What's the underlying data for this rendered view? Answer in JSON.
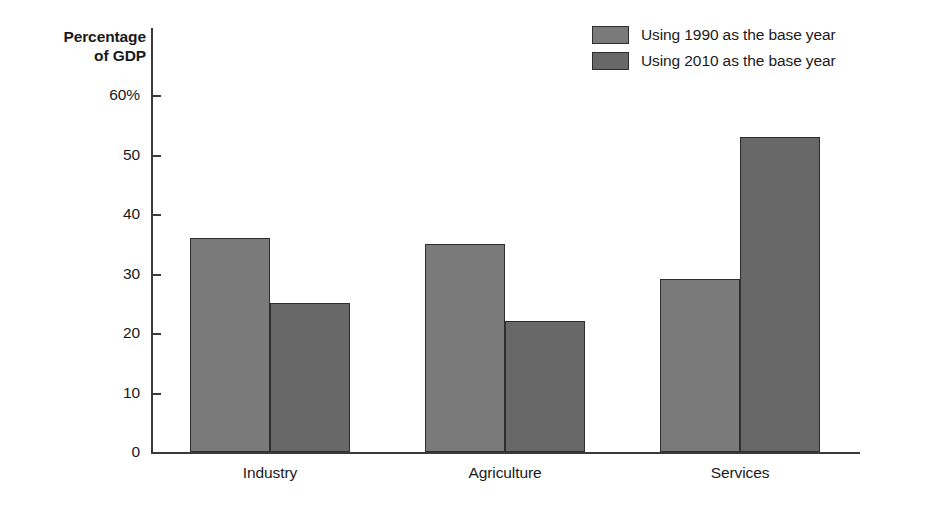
{
  "chart_data": {
    "type": "bar",
    "title": "",
    "ylabel": "Percentage\nof GDP",
    "xlabel": "",
    "categories": [
      "Industry",
      "Agriculture",
      "Services"
    ],
    "series": [
      {
        "name": "Using 1990 as the base year",
        "values": [
          36,
          35,
          29
        ],
        "color": "#7a7a7a"
      },
      {
        "name": "Using 2010 as the base year",
        "values": [
          25,
          22,
          53
        ],
        "color": "#686868"
      }
    ],
    "ylim": [
      0,
      60
    ],
    "yticks": [
      0,
      10,
      20,
      30,
      40,
      50,
      60
    ],
    "ytick_labels": [
      "0",
      "10",
      "20",
      "30",
      "40",
      "50",
      "60%"
    ],
    "grid": false,
    "legend_position": "top-right",
    "axis_color": "#3a3a3a",
    "bar_outline_color": "#2e2e2e"
  }
}
